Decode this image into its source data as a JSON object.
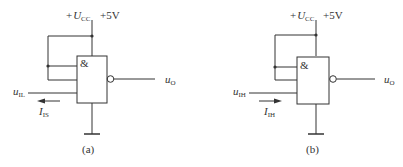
{
  "circuits": [
    {
      "id": "a",
      "caption": "(a)",
      "supply_prefix": "+",
      "supply_symbol": "U",
      "supply_sub": "CC",
      "supply_value": "+5V",
      "gate_symbol": "&",
      "input_symbol": "u",
      "input_sub": "IL",
      "current_symbol": "I",
      "current_sub": "IS",
      "current_direction": "left",
      "output_symbol": "u",
      "output_sub": "O"
    },
    {
      "id": "b",
      "caption": "(b)",
      "supply_prefix": "+",
      "supply_symbol": "U",
      "supply_sub": "CC",
      "supply_value": "+5V",
      "gate_symbol": "&",
      "input_symbol": "u",
      "input_sub": "IH",
      "current_symbol": "I",
      "current_sub": "IH",
      "current_direction": "right",
      "output_symbol": "u",
      "output_sub": "O"
    }
  ],
  "colors": {
    "line": "#333333",
    "background": "#ffffff"
  }
}
